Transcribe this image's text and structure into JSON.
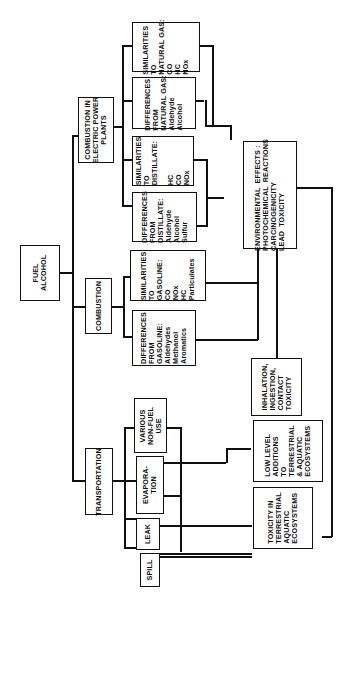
{
  "diagram": {
    "orientation": "rotated 90deg counter-clockwise (text reads bottom-to-top)",
    "root": {
      "label": "FUEL\nALCOHOL"
    },
    "branches": {
      "combustion_power_plants": {
        "label": "COMBUSTION IN\nELECTRIC POWER\nPLANTS"
      },
      "combustion": {
        "label": "COMBUSTION"
      },
      "transportation": {
        "label": "TRANSPORTATION"
      }
    },
    "leaves": {
      "sim_natural_gas": {
        "label": "SIMILARITIES\nTO\nNATURAL GAS:\nCO\nHC\nNOx"
      },
      "diff_natural_gas": {
        "label": "DIFFERENCES\nFROM\nNATURAL GAS:\nAldehyde\nAlcohol"
      },
      "sim_distillate": {
        "label": "SIMILARITIES\nTO\nDISTILLATE:\n\nHC\nCO\nNOx"
      },
      "diff_distillate": {
        "label": "DIFFERENCES\nFROM\nDISTILLATE:\nAldehyde\nAlcohol\nSulfur"
      },
      "sim_gasoline": {
        "label": "SIMILARITIES\nTO\nGASOLINE:\nCO\nNOx\nHC\nParticulates"
      },
      "diff_gasoline": {
        "label": "DIFFERENCES\nFROM\nGASOLINE:\nAldehydes\nMethanol\nAromatics"
      },
      "various_non_fuel": {
        "label": "VARIOUS\nNON-FUEL\nUSE"
      },
      "evaporation": {
        "label": "EVAPORA-\nTION"
      },
      "leak": {
        "label": "LEAK"
      },
      "spill": {
        "label": "SPILL"
      }
    },
    "effects": {
      "environmental": {
        "label": "ENVIRONMENTAL  EFFECTS :\nPHOTOCHEMICAL  REACTIONS\nCARCINOGENICITY\nLEAD  TOXICITY"
      },
      "inhalation": {
        "label": "INHALATION,\nINGESTION,\nCONTACT\nTOXICITY"
      },
      "low_level": {
        "label": "LOW LEVEL\nADDITIONS\nTO\nTERRESTRIAL\n& AQUATIC\nECOSYSTEMS"
      },
      "toxicity_terrestrial": {
        "label": "TOXICITY IN\nTERRESTRIAL\nAQUATIC\nECOSYSTEMS"
      }
    }
  }
}
